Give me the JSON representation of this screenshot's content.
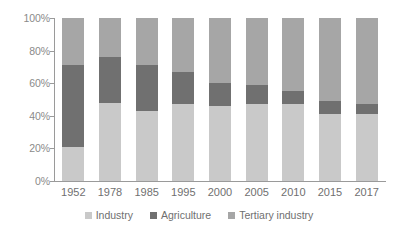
{
  "chart_data": {
    "type": "bar",
    "stacked": true,
    "stack_mode": "percent",
    "title": "",
    "subtitle": "",
    "xlabel": "",
    "ylabel": "",
    "grid": false,
    "legend_position": "bottom",
    "categories": [
      "1952",
      "1978",
      "1985",
      "1995",
      "2000",
      "2005",
      "2010",
      "2015",
      "2017"
    ],
    "ylim": [
      0,
      100
    ],
    "yticks": [
      0,
      20,
      40,
      60,
      80,
      100
    ],
    "ytick_labels": [
      "0%",
      "20%",
      "40%",
      "60%",
      "80%",
      "100%"
    ],
    "series": [
      {
        "name": "Industry",
        "color": "#c9c9c9",
        "values": [
          21,
          48,
          43,
          47,
          46,
          47,
          47,
          41,
          41
        ]
      },
      {
        "name": "Agriculture",
        "color": "#707070",
        "values": [
          50,
          28,
          28,
          20,
          14,
          12,
          8,
          8,
          6
        ]
      },
      {
        "name": "Tertiary industry",
        "color": "#a6a6a6",
        "values": [
          29,
          24,
          29,
          33,
          40,
          41,
          45,
          51,
          53
        ]
      }
    ]
  },
  "colors": {
    "axis": "#9a9a9a",
    "tick_text": "#8a8a8a",
    "label_text": "#6f6f6f",
    "background": "#ffffff",
    "industry": "#c9c9c9",
    "agriculture": "#707070",
    "tertiary": "#a6a6a6"
  }
}
